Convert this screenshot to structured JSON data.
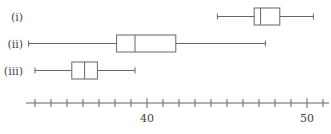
{
  "chart_data": {
    "type": "boxplot",
    "orientation": "horizontal",
    "title": "",
    "xlabel": "",
    "ylabel": "",
    "xlim": [
      32.4,
      51.3
    ],
    "x_ticks": [
      33,
      34,
      35,
      36,
      37,
      38,
      39,
      40,
      41,
      42,
      43,
      44,
      45,
      46,
      47,
      48,
      49,
      50,
      51
    ],
    "x_tick_labels": [
      {
        "value": 40,
        "label": "40"
      },
      {
        "value": 50,
        "label": "50"
      }
    ],
    "grid": false,
    "series": [
      {
        "name": "(i)",
        "min": 44.4,
        "q1": 46.7,
        "median": 47.1,
        "q3": 48.3,
        "max": 50.4
      },
      {
        "name": "(ii)",
        "min": 32.6,
        "q1": 38.1,
        "median": 39.25,
        "q3": 41.8,
        "max": 47.4
      },
      {
        "name": "(iii)",
        "min": 33.0,
        "q1": 35.3,
        "median": 36.1,
        "q3": 36.9,
        "max": 39.25
      }
    ]
  },
  "layout": {
    "px_per_unit": 16,
    "x_of_40": 147,
    "axis_y": 103,
    "axis_x_start": 26,
    "axis_x_end": 329,
    "row_centers": [
      16.5,
      43.5,
      70.5
    ],
    "box_half_height": 8.5,
    "whisker_cap_half": 3
  }
}
